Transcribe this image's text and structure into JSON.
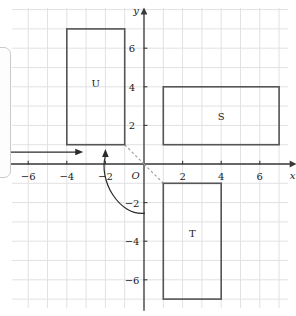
{
  "figure": {
    "kind": "coordinate-grid-diagram",
    "background_color": "#ffffff",
    "grid_line_color": "#e2e2e4",
    "axis_color": "#3a3a3a",
    "shape_stroke_color": "#555558",
    "dashed_color": "#9a9a9e",
    "arrow_color": "#2b2b2b"
  },
  "grid": {
    "left_px": 12,
    "top_px": 8,
    "right_px": 288,
    "bottom_px": 308,
    "cell_px": 19.3,
    "origin_x_px": 144,
    "origin_y_px": 164
  },
  "axes": {
    "x_label": "x",
    "y_label": "y",
    "origin_label": "O",
    "x_min": -6.9,
    "x_max": 7.6,
    "y_min": -7.6,
    "y_max": 7.8,
    "x_ticks": [
      -6,
      -4,
      -2,
      2,
      4,
      6
    ],
    "y_ticks": [
      6,
      4,
      2,
      -2,
      -4,
      -6
    ],
    "x_tick_labels": [
      "−6",
      "−4",
      "−2",
      "2",
      "4",
      "6"
    ],
    "y_tick_labels": [
      "6",
      "4",
      "2",
      "−2",
      "−4",
      "−6"
    ]
  },
  "shapes": [
    {
      "id": "U",
      "label": "U",
      "x_min": -4,
      "x_max": -1,
      "y_min": 1,
      "y_max": 7,
      "label_x": -2.5,
      "label_y": 4.2
    },
    {
      "id": "S",
      "label": "S",
      "x_min": 1,
      "x_max": 7,
      "y_min": 1,
      "y_max": 4,
      "label_x": 4.0,
      "label_y": 2.5
    },
    {
      "id": "T",
      "label": "T",
      "x_min": 1,
      "x_max": 4,
      "y_min": -7,
      "y_max": -1,
      "label_x": 2.5,
      "label_y": -3.6
    }
  ],
  "dashed_rays": [
    {
      "from_x": -1,
      "from_y": 1,
      "to_x": 0,
      "to_y": 0
    },
    {
      "from_x": 0,
      "from_y": 0,
      "to_x": 1,
      "to_y": -1
    }
  ],
  "annotations": {
    "translation_arrow": {
      "type": "straight-arrow",
      "direction": "right",
      "from_x": -7.0,
      "from_y": 0.62,
      "to_x": -3.2,
      "to_y": 0.62
    },
    "rotation_arrow": {
      "type": "curved-arrow",
      "direction": "counterclockwise",
      "from_x": 0.05,
      "from_y": -2.55,
      "to_x": -2.0,
      "to_y": 0.72
    }
  },
  "left_panel": {
    "visible": true,
    "clipped": true,
    "left_px": -8,
    "top_px": 47,
    "width_px": 19,
    "height_px": 131,
    "border_color": "#c9c9cc"
  }
}
